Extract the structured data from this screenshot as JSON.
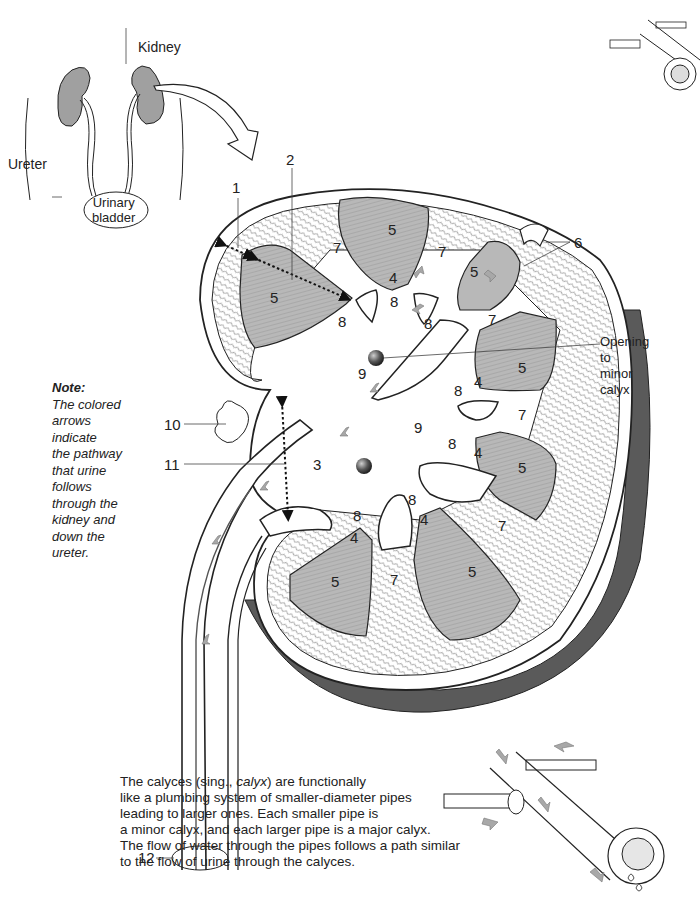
{
  "overview": {
    "labels": {
      "kidney": "Kidney",
      "ureter": "Ureter",
      "bladder_line1": "Urinary",
      "bladder_line2": "bladder"
    }
  },
  "structure_numbers": {
    "n1": "1",
    "n2": "2",
    "n3": "3",
    "n4": "4",
    "n5": "5",
    "n6": "6",
    "n7": "7",
    "n8": "8",
    "n9": "9",
    "n10": "10",
    "n11": "11",
    "n12": "12"
  },
  "annotation_opening": [
    "Opening",
    "to",
    "minor",
    "calyx"
  ],
  "note": {
    "title": "Note:",
    "lines": [
      "The colored",
      "arrows",
      "indicate",
      "the pathway",
      "that urine",
      "follows",
      "through the",
      "kidney and",
      "down the",
      "ureter."
    ]
  },
  "caption": {
    "line1_pre": "The calyces (sing., ",
    "line1_em": "calyx",
    "line1_post": ") are functionally",
    "line2": "like a plumbing system of smaller-diameter pipes",
    "line3": "leading to larger ones. Each smaller pipe is",
    "line4": "a minor calyx, and each larger pipe is a major calyx.",
    "line5": "The flow of water through the pipes follows a path similar",
    "line6": "to the flow of urine through the calyces."
  },
  "colors": {
    "pyramid_fill": "#b8b8b8",
    "capsule_dark": "#5a5a5a",
    "arrow_fill": "#a8a8a8",
    "line": "#222222",
    "kidney_small": "#a0a0a0"
  }
}
